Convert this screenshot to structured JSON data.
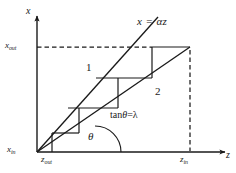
{
  "figure": {
    "type": "diagram",
    "title": "",
    "background_color": "#ffffff",
    "line_color": "#1a1a1a",
    "axes": {
      "x_axis_label": "x",
      "z_axis_label": "z",
      "origin_px": [
        37,
        152
      ],
      "x_axis_top_px": [
        37,
        14
      ],
      "z_axis_right_px": [
        228,
        152
      ]
    },
    "labels": {
      "x_axis": "x",
      "z_axis": "z",
      "x_out": "x",
      "x_out_sub": "out",
      "x_in": "x",
      "x_in_sub": "in",
      "z_out": "z",
      "z_out_sub": "out",
      "z_in": "z",
      "z_in_sub": "in",
      "line1_equation": "x = αz",
      "line2_annotation_prefix": "tan",
      "line2_annotation_theta": "θ",
      "line2_annotation_suffix": "=λ",
      "curve_1": "1",
      "curve_2": "2",
      "angle_theta": "θ"
    },
    "lines": {
      "line1": {
        "name": "x = αz",
        "from_px": [
          37,
          152
        ],
        "to_px": [
          157,
          18
        ],
        "slope_note": "steeper line, slope alpha"
      },
      "line2": {
        "name": "tanθ=λ",
        "from_px": [
          37,
          152
        ],
        "to_px": [
          190,
          47
        ],
        "slope_note": "shallower line, slope lambda = tan(theta)"
      }
    },
    "dashed": {
      "horizontal_x_out": {
        "from_px": [
          37,
          47
        ],
        "to_px": [
          118,
          47
        ]
      },
      "vertical_z_in": {
        "from_px": [
          190,
          47
        ],
        "to_px": [
          190,
          152
        ]
      }
    },
    "solid_top": {
      "from_px": [
        118,
        47
      ],
      "to_px": [
        190,
        47
      ]
    },
    "staircase_points_px": [
      [
        37,
        152
      ],
      [
        55,
        152
      ],
      [
        55,
        132
      ],
      [
        73,
        132
      ],
      [
        73,
        132
      ],
      [
        55,
        132
      ]
    ],
    "staircase_segments": [
      {
        "kind": "vertical",
        "from_px": [
          55,
          152
        ],
        "to_px": [
          55,
          133
        ]
      },
      {
        "kind": "horizontal",
        "from_px": [
          55,
          133
        ],
        "to_px": [
          76,
          133
        ]
      },
      {
        "kind": "vertical",
        "from_px": [
          76,
          133
        ],
        "to_px": [
          76,
          118
        ]
      },
      {
        "kind": "horizontal",
        "from_px": [
          76,
          118
        ],
        "to_px": [
          76,
          118
        ]
      },
      {
        "kind": "vertical",
        "from_px": [
          76,
          118
        ],
        "to_px": [
          76,
          118
        ]
      },
      {
        "kind": "horizontal",
        "from_px": [
          66,
          108
        ],
        "to_px": [
          118,
          108
        ]
      },
      {
        "kind": "vertical",
        "from_px": [
          118,
          108
        ],
        "to_px": [
          118,
          78
        ]
      },
      {
        "kind": "horizontal",
        "from_px": [
          95,
          78
        ],
        "to_px": [
          152,
          78
        ]
      },
      {
        "kind": "vertical",
        "from_px": [
          152,
          78
        ],
        "to_px": [
          152,
          47
        ]
      }
    ],
    "angle_arc": {
      "vertex_px": [
        95,
        152
      ],
      "radius_px": 26,
      "label": "θ"
    }
  }
}
